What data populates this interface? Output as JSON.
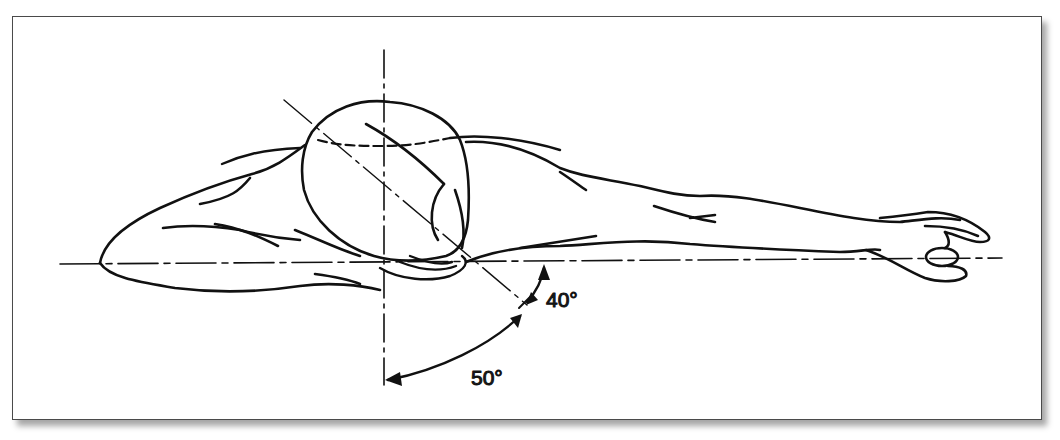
{
  "figure": {
    "angles": [
      {
        "label": "40°",
        "value": 40,
        "between": "horizontal body axis and head axis"
      },
      {
        "label": "50°",
        "value": 50,
        "between": "head axis and vertical axis"
      }
    ],
    "colors": {
      "line": "#111111",
      "frame": "#4a4a4a",
      "background": "#ffffff"
    }
  }
}
